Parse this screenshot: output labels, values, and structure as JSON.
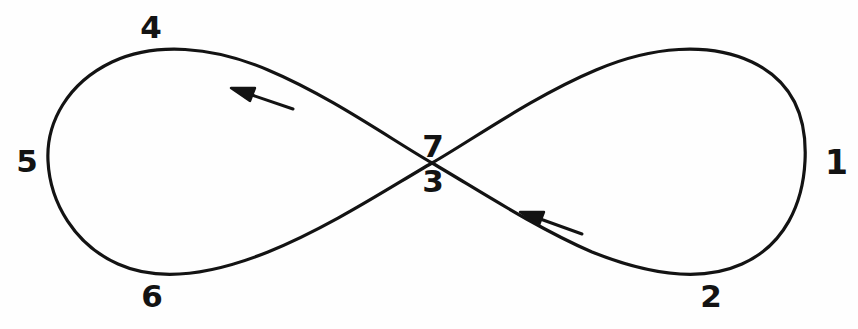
{
  "figure": {
    "background_color": "#fefefe",
    "ink_color": "#131313",
    "stroke_width": 3.2,
    "width": 858,
    "height": 329
  },
  "labels": [
    {
      "id": "label-1",
      "text": "1",
      "x": 836,
      "y": 162,
      "role": "right-lobe-rightmost-point"
    },
    {
      "id": "label-2",
      "text": "2",
      "x": 711,
      "y": 296,
      "role": "right-lobe-bottom-point"
    },
    {
      "id": "label-3",
      "text": "3",
      "x": 433,
      "y": 181,
      "role": "crossing-point-lower"
    },
    {
      "id": "label-4",
      "text": "4",
      "x": 151,
      "y": 27,
      "role": "left-lobe-top-point"
    },
    {
      "id": "label-5",
      "text": "5",
      "x": 27,
      "y": 161,
      "role": "left-lobe-leftmost-point"
    },
    {
      "id": "label-6",
      "text": "6",
      "x": 152,
      "y": 296,
      "role": "left-lobe-bottom-point"
    },
    {
      "id": "label-7",
      "text": "7",
      "x": 433,
      "y": 146,
      "role": "crossing-point-upper"
    }
  ],
  "crossing_point": {
    "x": 432,
    "y": 163
  },
  "lobes": {
    "left": {
      "leftmost_x": 48,
      "top_y": 46,
      "bottom_y": 273,
      "apex_x": 152
    },
    "right": {
      "rightmost_x": 805,
      "top_y": 45,
      "bottom_y": 272,
      "apex_x": 712
    }
  },
  "arrows": [
    {
      "id": "arrow-upper",
      "direction": "up-left",
      "tip_x": 233,
      "tip_y": 89,
      "tail_x": 293,
      "tail_y": 109,
      "segment": "upper-diagonal"
    },
    {
      "id": "arrow-lower",
      "direction": "up-left",
      "tip_x": 522,
      "tip_y": 213,
      "tail_x": 582,
      "tail_y": 234,
      "segment": "lower-diagonal"
    }
  ],
  "path_d": "M 432 163 C 392 140 330 96 268 70 C 212 46 155 42 112 62 C 68 83 46 122 48 161 C 50 203 75 245 118 264 C 160 283 213 274 268 252 C 330 227 392 186 432 163 C 472 140 534 96 596 70 C 652 46 709 42 752 62 C 796 83 807 122 805 161 C 803 203 785 245 742 264 C 700 283 647 274 592 252 C 534 227 472 186 432 163 Z"
}
